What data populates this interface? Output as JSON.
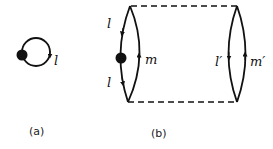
{
  "diagram": {
    "panel_a": {
      "caption": "(a)",
      "loop_label": "l"
    },
    "panel_b": {
      "caption": "(b)",
      "left_lens": {
        "upper_label": "l",
        "lower_label": "l",
        "right_arc_label": "m"
      },
      "right_lens": {
        "left_arc_label": "l′",
        "right_arc_label": "m′"
      }
    },
    "colors": {
      "stroke": "#111111",
      "background": "#ffffff"
    }
  }
}
